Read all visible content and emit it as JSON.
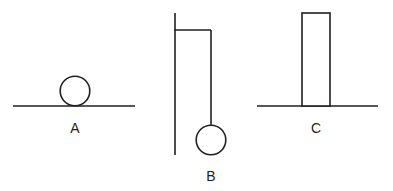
{
  "figure": {
    "background_color": "#ffffff",
    "stroke_color": "#231f20",
    "stroke_width": 1.6,
    "width": 393,
    "height": 191
  },
  "panels": [
    {
      "id": "A",
      "label": "A",
      "label_x": 75,
      "label_y": 133,
      "description": "Ball resting on a flat horizontal surface",
      "ground": {
        "name": "ground-line-a",
        "x1": 13,
        "y1": 106,
        "x2": 135,
        "y2": 106
      },
      "ball": {
        "name": "ball-a",
        "cx": 75,
        "cy": 91,
        "r": 14.8
      }
    },
    {
      "id": "B",
      "label": "B",
      "label_x": 211,
      "label_y": 181,
      "description": "Ball hanging from a rod attached to a vertical wall",
      "wall": {
        "name": "wall-line-b",
        "x1": 175,
        "y1": 13,
        "x2": 175,
        "y2": 155
      },
      "arm": {
        "name": "support-arm-b",
        "x1": 175,
        "y1": 30,
        "x2": 211,
        "y2": 30
      },
      "rod": {
        "name": "hanging-rod-b",
        "x1": 211,
        "y1": 30,
        "x2": 211,
        "y2": 126
      },
      "ball": {
        "name": "ball-b",
        "cx": 211,
        "cy": 140,
        "r": 14.8
      }
    },
    {
      "id": "C",
      "label": "C",
      "label_x": 316,
      "label_y": 133,
      "description": "Tall upright rectangular block standing on a horizontal surface",
      "ground": {
        "name": "ground-line-c",
        "x1": 257,
        "y1": 106,
        "x2": 378,
        "y2": 106
      },
      "block": {
        "name": "block-c",
        "x": 302,
        "y": 13,
        "width": 28,
        "height": 93
      }
    }
  ]
}
